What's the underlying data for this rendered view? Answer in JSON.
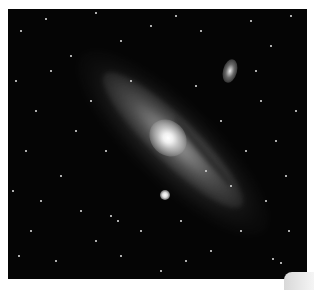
{
  "image": {
    "subject": "Andromeda galaxy",
    "alt": "Spiral galaxy photographed against a starfield, with a satellite galaxy at upper right and a bright foreground star below the core",
    "background_color": "#050505",
    "page_color": "#ffffff"
  },
  "features": [
    {
      "name": "galaxy-core",
      "x": 163,
      "y": 133
    },
    {
      "name": "satellite-galaxy",
      "x": 229,
      "y": 69
    },
    {
      "name": "foreground-star",
      "x": 165,
      "y": 194
    }
  ],
  "stars": [
    [
      20,
      30
    ],
    [
      45,
      18
    ],
    [
      70,
      55
    ],
    [
      95,
      12
    ],
    [
      120,
      40
    ],
    [
      150,
      25
    ],
    [
      175,
      15
    ],
    [
      200,
      30
    ],
    [
      250,
      20
    ],
    [
      270,
      45
    ],
    [
      290,
      15
    ],
    [
      15,
      80
    ],
    [
      35,
      110
    ],
    [
      25,
      150
    ],
    [
      12,
      190
    ],
    [
      30,
      230
    ],
    [
      55,
      260
    ],
    [
      80,
      210
    ],
    [
      60,
      175
    ],
    [
      95,
      240
    ],
    [
      120,
      255
    ],
    [
      140,
      230
    ],
    [
      180,
      220
    ],
    [
      210,
      250
    ],
    [
      240,
      230
    ],
    [
      265,
      200
    ],
    [
      285,
      175
    ],
    [
      275,
      140
    ],
    [
      295,
      110
    ],
    [
      260,
      100
    ],
    [
      245,
      150
    ],
    [
      230,
      185
    ],
    [
      195,
      85
    ],
    [
      130,
      80
    ],
    [
      105,
      150
    ],
    [
      75,
      130
    ],
    [
      50,
      70
    ],
    [
      185,
      260
    ],
    [
      160,
      270
    ],
    [
      220,
      120
    ],
    [
      110,
      215
    ],
    [
      117,
      220
    ],
    [
      272,
      258
    ],
    [
      280,
      262
    ],
    [
      40,
      200
    ],
    [
      90,
      100
    ],
    [
      205,
      170
    ],
    [
      255,
      70
    ],
    [
      288,
      230
    ],
    [
      18,
      255
    ]
  ]
}
